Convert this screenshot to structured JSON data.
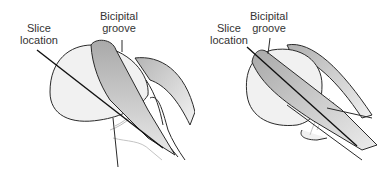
{
  "figure": {
    "panels": [
      {
        "id": "left",
        "labels": {
          "slice": [
            "Slice",
            "location"
          ],
          "groove": [
            "Bicipital",
            "groove"
          ]
        }
      },
      {
        "id": "right",
        "labels": {
          "slice": [
            "Slice",
            "location"
          ],
          "groove": [
            "Bicipital",
            "groove"
          ]
        }
      }
    ],
    "colors": {
      "outline": "#2a2a2a",
      "humeral_head": "#f1f1f1",
      "tendon": "#b9b9b9",
      "tendon_light": "#e6e6e6",
      "faint_line": "#c4c4c4"
    }
  }
}
